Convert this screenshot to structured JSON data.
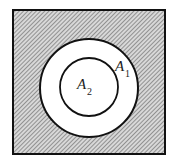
{
  "diagram": {
    "regions": [
      {
        "id": "outer",
        "shaded": true
      },
      {
        "id": "annulus",
        "label_base": "A",
        "label_sub": "1",
        "shaded": false
      },
      {
        "id": "inner",
        "label_base": "A",
        "label_sub": "2",
        "shaded": false
      }
    ],
    "colors": {
      "stroke": "#111111",
      "hatch": "#555555",
      "fill": "#ffffff"
    }
  }
}
